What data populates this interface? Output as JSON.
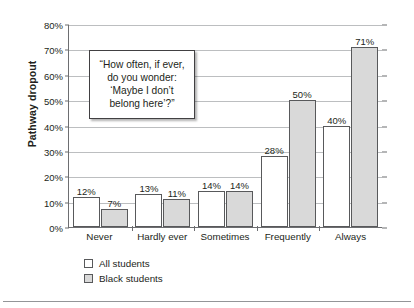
{
  "chart_data": {
    "type": "bar",
    "title": "",
    "xlabel": "",
    "ylabel": "Pathway dropout",
    "ylim": [
      0,
      80
    ],
    "ytick_labels": [
      "0%",
      "10%",
      "20%",
      "30%",
      "40%",
      "50%",
      "60%",
      "70%",
      "80%"
    ],
    "ytick_values": [
      0,
      10,
      20,
      30,
      40,
      50,
      60,
      70,
      80
    ],
    "grid": true,
    "legend_position": "bottom-left",
    "categories": [
      "Never",
      "Hardly ever",
      "Sometimes",
      "Frequently",
      "Always"
    ],
    "series": [
      {
        "name": "All students",
        "color": "#ffffff",
        "values": [
          12,
          13,
          14,
          28,
          40
        ],
        "labels": [
          "12%",
          "13%",
          "14%",
          "28%",
          "40%"
        ]
      },
      {
        "name": "Black students",
        "color": "#d9d9d9",
        "values": [
          7,
          11,
          14,
          50,
          71
        ],
        "labels": [
          "7%",
          "11%",
          "14%",
          "50%",
          "71%"
        ]
      }
    ],
    "annotations": [
      {
        "name": "question-callout",
        "lines": [
          "“How often, if ever,",
          "do you wonder:",
          "‘Maybe I don’t",
          "belong here’?”"
        ]
      }
    ]
  }
}
